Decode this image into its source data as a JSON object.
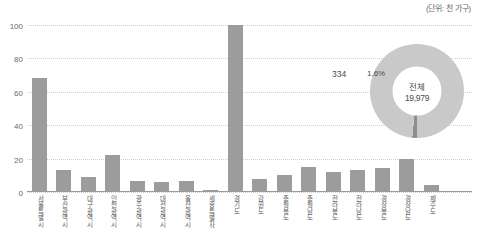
{
  "unit_caption": "(단위: 천 가구)",
  "donut": {
    "center_label": "전체",
    "center_value": "19,979",
    "segment_percent": "1.6%",
    "segment_value": "334"
  },
  "chart_data": {
    "type": "bar",
    "title": "",
    "xlabel": "",
    "ylabel": "",
    "ylim": [
      0,
      100
    ],
    "yticks": [
      "0",
      "20",
      "40",
      "60",
      "80",
      "100"
    ],
    "grid": true,
    "legend": "none",
    "unit": "(단위: 천 가구)",
    "categories": [
      "서울특별시",
      "부산광역시",
      "대구광역시",
      "인천광역시",
      "광주광역시",
      "대전광역시",
      "울산광역시",
      "세종특별자치시",
      "경기도",
      "강원도",
      "충청북도",
      "충청남도",
      "전라북도",
      "전라남도",
      "경상북도",
      "경상남도",
      "제주도"
    ],
    "values": [
      68,
      13,
      9,
      22,
      6.5,
      6,
      6.5,
      1,
      100,
      8,
      10,
      15,
      12,
      13,
      14.5,
      20,
      4.5
    ],
    "donut": {
      "type": "pie",
      "labels": [
        "해당",
        "전체"
      ],
      "values": [
        334,
        19979
      ],
      "percent": [
        1.6,
        98.4
      ],
      "center_text": "전체 19,979",
      "colors": [
        "#8d8d8d",
        "#c9c9c9"
      ]
    }
  },
  "colors": {
    "bar": "#9c9c9c",
    "grid": "#cfcfcf",
    "donut_ring": "#c9c9c9",
    "donut_segment": "#8d8d8d",
    "text": "#4a4a4a"
  }
}
